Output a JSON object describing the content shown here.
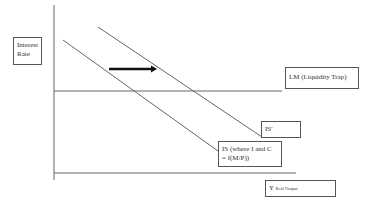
{
  "diagram": {
    "type": "IS-LM liquidity trap diagram",
    "y_axis_label": "Interest Rate",
    "x_axis_label_main": "Y",
    "x_axis_label_sub": "Real Output",
    "lm_label": "LM (Liquidity Trap)",
    "is_shifted_label": "IS'",
    "is_label_line1": "IS (where I and C",
    "is_label_line2": "= f(M/P))",
    "arrow_direction": "right",
    "colors": {
      "lines": "#666666",
      "arrow": "#111111",
      "box_border": "#555555"
    }
  }
}
